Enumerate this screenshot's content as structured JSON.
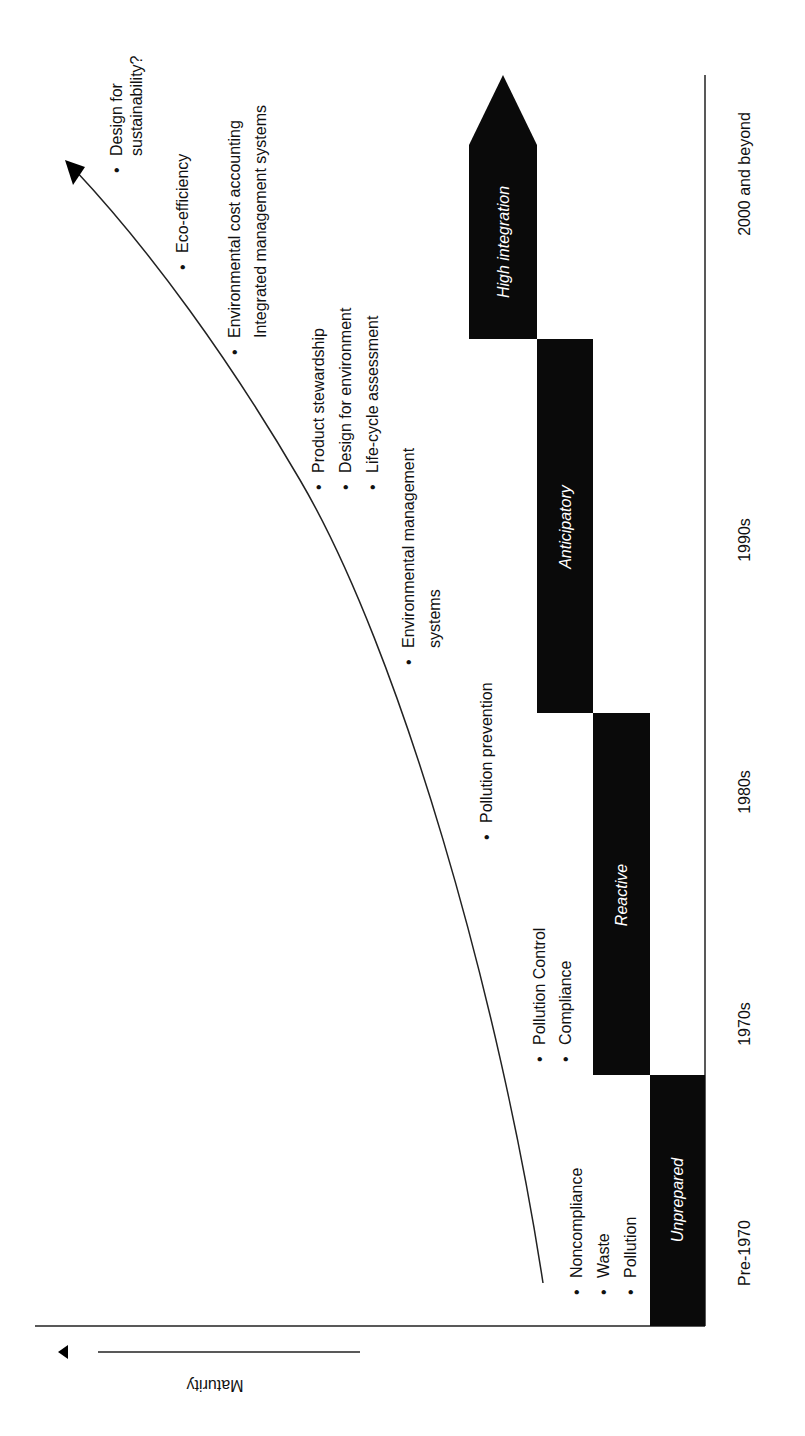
{
  "diagram": {
    "axis_label": "Maturity",
    "colors": {
      "block": "#0a0a0a",
      "line": "#222222",
      "text": "#111111",
      "stage_text": "#ffffff",
      "background": "#ffffff"
    },
    "periods": [
      "Pre-1970",
      "1970s",
      "1980s",
      "1990s",
      "2000 and beyond"
    ],
    "stages": [
      {
        "label": "Unprepared"
      },
      {
        "label": "Reactive"
      },
      {
        "label": "Anticipatory"
      },
      {
        "label": "High integration"
      }
    ],
    "practices": {
      "unprepared": [
        "Noncompliance",
        "Waste",
        "Pollution"
      ],
      "reactive": [
        "Pollution Control",
        "Compliance"
      ],
      "pollution_prevention": "Pollution prevention",
      "ems_line1": "Environmental management",
      "ems_line2": "systems",
      "anticipatory": [
        "Product stewardship",
        "Design for environment",
        "Life-cycle assessment"
      ],
      "integration_line1": "Environmental cost accounting",
      "integration_line2": "Integrated management systems",
      "eco": "Eco-efficiency",
      "sustain_line1": "Design for",
      "sustain_line2": "sustainability?"
    },
    "bullet": "•"
  }
}
